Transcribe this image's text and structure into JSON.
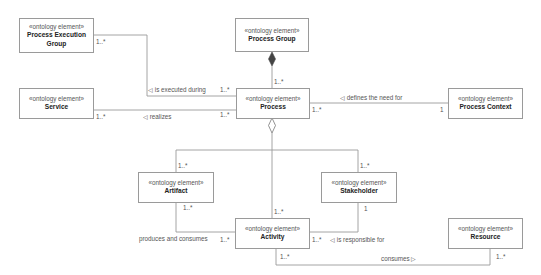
{
  "diagram": {
    "type": "UML class diagram",
    "stereotype": "«ontology element»",
    "elements": {
      "process_execution_group": {
        "stereotype": "«ontology element»",
        "name": "Process Execution Group",
        "name_line1": "Process Execution",
        "name_line2": "Group"
      },
      "process_group": {
        "stereotype": "«ontology element»",
        "name": "Process Group"
      },
      "service": {
        "stereotype": "«ontology element»",
        "name": "Service"
      },
      "process": {
        "stereotype": "«ontology element»",
        "name": "Process"
      },
      "process_context": {
        "stereotype": "«ontology element»",
        "name": "Process Context"
      },
      "artifact": {
        "stereotype": "«ontology element»",
        "name": "Artifact"
      },
      "stakeholder": {
        "stereotype": "«ontology element»",
        "name": "Stakeholder"
      },
      "activity": {
        "stereotype": "«ontology element»",
        "name": "Activity"
      },
      "resource": {
        "stereotype": "«ontology element»",
        "name": "Resource"
      }
    },
    "relations": {
      "is_executed_during": {
        "label": "◁ is executed during",
        "from": "Process",
        "to": "Process Execution Group",
        "mult_from": "1..*",
        "mult_to": "1..*"
      },
      "process_group_composition": {
        "label": "",
        "type": "composition",
        "whole": "Process Group",
        "part": "Process",
        "mult_part": "1..*"
      },
      "realizes": {
        "label": "◁ realizes",
        "from": "Process",
        "to": "Service",
        "mult_from": "1..*",
        "mult_to": "1..*"
      },
      "defines_the_need_for": {
        "label": "◁ defines the need for",
        "from": "Process Context",
        "to": "Process",
        "mult_from": "1",
        "mult_to": "1..*"
      },
      "process_aggregation": {
        "label": "",
        "type": "aggregation",
        "whole": "Process",
        "parts": [
          "Artifact",
          "Activity",
          "Stakeholder"
        ],
        "mult_artifact": "1..*",
        "mult_activity": "1..*",
        "mult_stakeholder": "1..*"
      },
      "produces_and_consumes": {
        "label": "produces and consumes",
        "from": "Activity",
        "to": "Artifact",
        "mult_from": "1..*",
        "mult_to": "1..*"
      },
      "is_responsible_for": {
        "label": "◁ is responsible for",
        "from": "Stakeholder",
        "to": "Activity",
        "mult_from": "1",
        "mult_to": "1..*"
      },
      "consumes": {
        "label": "consumes ▷",
        "from": "Activity",
        "to": "Resource",
        "mult_from": "1..*",
        "mult_to": "1..*"
      }
    },
    "colors": {
      "line": "#9a9a9a",
      "box_border": "#9a9a9a",
      "text": "#222222",
      "label_text": "#555555"
    }
  }
}
